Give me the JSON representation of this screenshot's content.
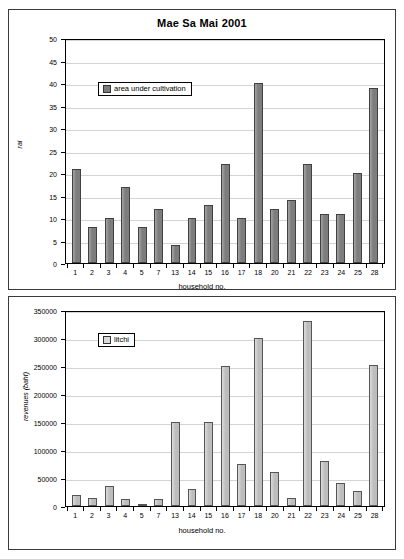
{
  "chart_data": [
    {
      "type": "bar",
      "title": "Mae Sa Mai 2001",
      "xlabel": "household no.",
      "ylabel": "rai",
      "categories": [
        "1",
        "2",
        "3",
        "4",
        "5",
        "7",
        "13",
        "14",
        "15",
        "16",
        "17",
        "18",
        "20",
        "21",
        "22",
        "23",
        "24",
        "25",
        "28"
      ],
      "values": [
        21,
        8,
        10,
        17,
        8,
        12,
        4,
        10,
        13,
        22,
        10,
        40,
        12,
        14,
        22,
        11,
        11,
        20,
        39
      ],
      "ylim": [
        0,
        50
      ],
      "ytick_step": 5,
      "yticks": [
        "0",
        "5",
        "10",
        "15",
        "20",
        "25",
        "30",
        "35",
        "40",
        "45",
        "50"
      ],
      "legend": [
        "area under cultivation"
      ],
      "legend_position": "top-left-inside",
      "grid": true,
      "series_color": "#7d7d7d"
    },
    {
      "type": "bar",
      "title": "",
      "xlabel": "household no.",
      "ylabel": "revenues (baht)",
      "categories": [
        "1",
        "2",
        "3",
        "4",
        "5",
        "7",
        "13",
        "14",
        "15",
        "16",
        "17",
        "18",
        "20",
        "21",
        "22",
        "23",
        "24",
        "25",
        "28"
      ],
      "values": [
        20000,
        15000,
        36000,
        12000,
        4000,
        12000,
        150000,
        31000,
        150000,
        250000,
        75000,
        300000,
        60000,
        15000,
        331000,
        80000,
        41000,
        26000,
        251000
      ],
      "ylim": [
        0,
        350000
      ],
      "ytick_step": 50000,
      "yticks": [
        "0",
        "50000",
        "100000",
        "150000",
        "200000",
        "250000",
        "300000",
        "350000"
      ],
      "legend": [
        "litchi"
      ],
      "legend_position": "top-left-inside",
      "grid": true,
      "series_color": "#bdbdbd"
    }
  ]
}
